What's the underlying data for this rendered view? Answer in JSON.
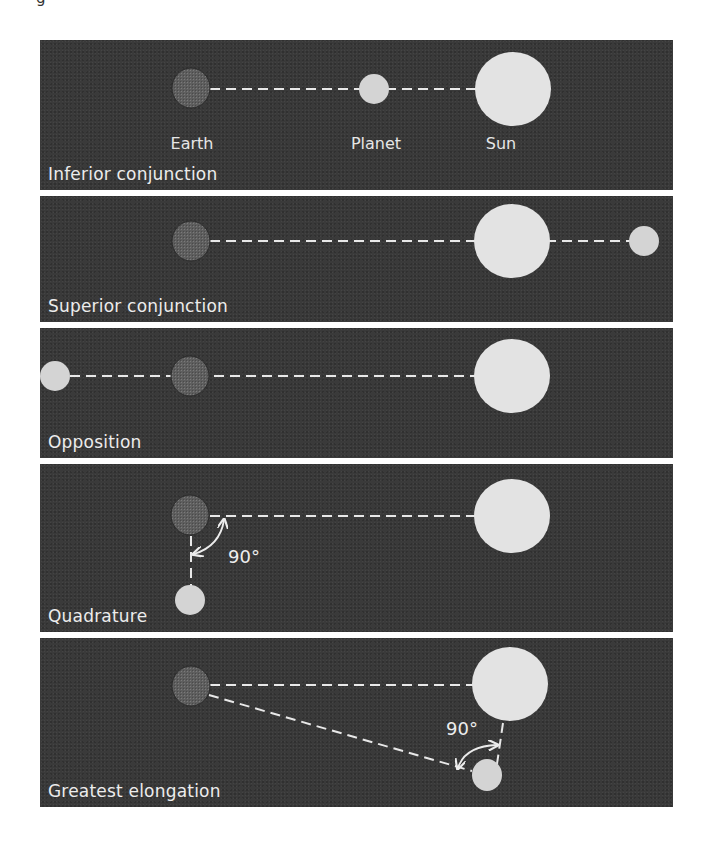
{
  "figure": {
    "caption_fragment": "g",
    "colors": {
      "panel_background": "#3a3a3a",
      "panel_separator": "#ffffff",
      "sun": "#e3e3e3",
      "planet": "#d4d4d4",
      "earth": "#5c5c5c",
      "line": "#e8e8e8",
      "text": "#ececec"
    },
    "panels": [
      {
        "id": "inferior-conjunction",
        "title": "Inferior conjunction",
        "labels": {
          "earth": "Earth",
          "planet": "Planet",
          "sun": "Sun"
        }
      },
      {
        "id": "superior-conjunction",
        "title": "Superior conjunction"
      },
      {
        "id": "opposition",
        "title": "Opposition"
      },
      {
        "id": "quadrature",
        "title": "Quadrature",
        "angle_label": "90°"
      },
      {
        "id": "greatest-elongation",
        "title": "Greatest elongation",
        "angle_label": "90°"
      }
    ]
  }
}
